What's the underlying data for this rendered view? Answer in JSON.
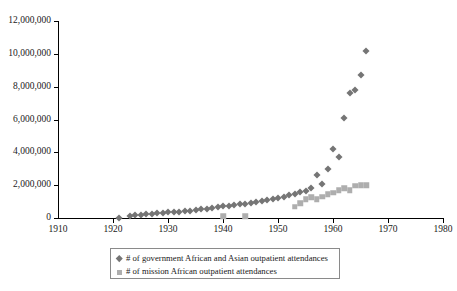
{
  "chart_data": {
    "type": "scatter",
    "title": "",
    "xlabel": "",
    "ylabel": "",
    "xlim": [
      1910,
      1980
    ],
    "ylim": [
      0,
      12000000
    ],
    "xticks": [
      1910,
      1920,
      1930,
      1940,
      1950,
      1960,
      1970,
      1980
    ],
    "yticks": [
      0,
      2000000,
      4000000,
      6000000,
      8000000,
      10000000,
      12000000
    ],
    "ytick_labels": [
      "0",
      "2,000,000",
      "4,000,000",
      "6,000,000",
      "8,000,000",
      "10,000,000",
      "12,000,000"
    ],
    "xtick_labels": [
      "1910",
      "1920",
      "1930",
      "1940",
      "1950",
      "1960",
      "1970",
      "1980"
    ],
    "grid": false,
    "legend_position": "below-axes",
    "series": [
      {
        "name": "# of government African and Asian outpatient attendances",
        "marker": "diamond",
        "color": "#757575",
        "points": [
          [
            1921,
            30000
          ],
          [
            1923,
            120000
          ],
          [
            1924,
            160000
          ],
          [
            1925,
            200000
          ],
          [
            1926,
            230000
          ],
          [
            1927,
            265000
          ],
          [
            1928,
            290000
          ],
          [
            1929,
            320000
          ],
          [
            1930,
            350000
          ],
          [
            1931,
            370000
          ],
          [
            1932,
            390000
          ],
          [
            1933,
            420000
          ],
          [
            1934,
            450000
          ],
          [
            1935,
            480000
          ],
          [
            1936,
            520000
          ],
          [
            1937,
            560000
          ],
          [
            1938,
            620000
          ],
          [
            1939,
            680000
          ],
          [
            1940,
            720000
          ],
          [
            1941,
            760000
          ],
          [
            1942,
            800000
          ],
          [
            1943,
            840000
          ],
          [
            1944,
            880000
          ],
          [
            1945,
            930000
          ],
          [
            1946,
            980000
          ],
          [
            1947,
            1030000
          ],
          [
            1948,
            1090000
          ],
          [
            1949,
            1150000
          ],
          [
            1950,
            1220000
          ],
          [
            1951,
            1300000
          ],
          [
            1952,
            1380000
          ],
          [
            1953,
            1470000
          ],
          [
            1954,
            1560000
          ],
          [
            1955,
            1650000
          ],
          [
            1956,
            1800000
          ],
          [
            1957,
            2600000
          ],
          [
            1958,
            2100000
          ],
          [
            1959,
            3000000
          ],
          [
            1960,
            4200000
          ],
          [
            1961,
            3700000
          ],
          [
            1962,
            6100000
          ],
          [
            1963,
            7600000
          ],
          [
            1964,
            7800000
          ],
          [
            1965,
            8700000
          ],
          [
            1966,
            10200000
          ]
        ]
      },
      {
        "name": "# of mission African outpatient attendances",
        "marker": "square",
        "color": "#aeaeae",
        "points": [
          [
            1940,
            120000
          ],
          [
            1944,
            110000
          ],
          [
            1953,
            700000
          ],
          [
            1954,
            900000
          ],
          [
            1955,
            1150000
          ],
          [
            1956,
            1250000
          ],
          [
            1957,
            1150000
          ],
          [
            1958,
            1300000
          ],
          [
            1959,
            1450000
          ],
          [
            1960,
            1550000
          ],
          [
            1961,
            1700000
          ],
          [
            1962,
            1800000
          ],
          [
            1963,
            1700000
          ],
          [
            1964,
            1950000
          ],
          [
            1965,
            2000000
          ],
          [
            1966,
            2000000
          ]
        ]
      }
    ]
  },
  "legend": {
    "items": [
      {
        "label": "# of government African and Asian outpatient attendances",
        "marker": "diamond"
      },
      {
        "label": "# of mission African outpatient attendances",
        "marker": "square"
      }
    ]
  }
}
